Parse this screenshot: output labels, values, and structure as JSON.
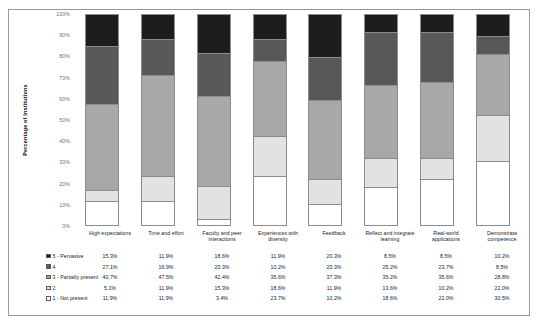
{
  "chart_data": {
    "type": "bar",
    "subtype": "stacked-bar-100-percent",
    "title": "",
    "xlabel": "",
    "ylabel": "Percentage of Institutions",
    "ylim": [
      0,
      100
    ],
    "ytick_labels": [
      "100%",
      "90%",
      "80%",
      "70%",
      "60%",
      "50%",
      "40%",
      "30%",
      "20%",
      "10%",
      "0%"
    ],
    "grid": false,
    "legend_position": "bottom-left",
    "stack_order_top_to_bottom": [
      "5 - Pervasive",
      "4",
      "3 - Partially present",
      "2",
      "1 - Not present"
    ],
    "categories": [
      "High expectations",
      "Time and effort",
      "Faculty and peer interactions",
      "Experiences with diversity",
      "Feedback",
      "Reflect and integrate learning",
      "Real-world applications",
      "Demonstrate competence"
    ],
    "series": [
      {
        "name": "5 - Pervasive",
        "color": "#1c1c1c",
        "values": [
          15.3,
          11.9,
          18.6,
          11.9,
          20.3,
          8.5,
          8.5,
          10.2
        ],
        "labels": [
          "15.3%",
          "11.9%",
          "18.6%",
          "11.9%",
          "20.3%",
          "8.5%",
          "8.5%",
          "10.2%"
        ]
      },
      {
        "name": "4",
        "color": "#585858",
        "values": [
          27.1,
          16.9,
          20.3,
          10.2,
          20.3,
          25.2,
          23.7,
          8.5
        ],
        "labels": [
          "27.1%",
          "16.9%",
          "20.3%",
          "10.2%",
          "20.3%",
          "25.2%",
          "23.7%",
          "8.5%"
        ]
      },
      {
        "name": "3 - Partially present",
        "color": "#a8a8a8",
        "values": [
          40.7,
          47.5,
          42.4,
          35.6,
          37.3,
          35.2,
          35.6,
          28.8
        ],
        "labels": [
          "40.7%",
          "47.5%",
          "42.4%",
          "35.6%",
          "37.3%",
          "35.2%",
          "35.6%",
          "28.8%"
        ]
      },
      {
        "name": "2",
        "color": "#e2e2e2",
        "values": [
          5.1,
          11.9,
          15.3,
          18.6,
          11.9,
          13.6,
          10.2,
          22.0
        ],
        "labels": [
          "5.1%",
          "11.9%",
          "15.3%",
          "18.6%",
          "11.9%",
          "13.6%",
          "10.2%",
          "22.0%"
        ]
      },
      {
        "name": "1 - Not present",
        "color": "#ffffff",
        "values": [
          11.9,
          11.9,
          3.4,
          23.7,
          10.2,
          18.6,
          22.0,
          30.5
        ],
        "labels": [
          "11.9%",
          "11.9%",
          "3.4%",
          "23.7%",
          "10.2%",
          "18.6%",
          "22.0%",
          "30.5%"
        ]
      }
    ]
  }
}
